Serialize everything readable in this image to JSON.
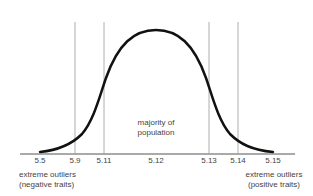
{
  "diagram": {
    "type": "bell-curve",
    "ticks": [
      {
        "label": "5.5",
        "x": 40
      },
      {
        "label": "5.9",
        "x": 75
      },
      {
        "label": "5.11",
        "x": 104
      },
      {
        "label": "5.12",
        "x": 156
      },
      {
        "label": "5.13",
        "x": 209
      },
      {
        "label": "5.14",
        "x": 238
      },
      {
        "label": "5.15",
        "x": 273
      }
    ],
    "center_label_line1": "majority of",
    "center_label_line2": "population",
    "left_label_line1": "extreme outliers",
    "left_label_line2": "(negative traits)",
    "right_label_line1": "extreme outliers",
    "right_label_line2": "(positive traits)",
    "colors": {
      "curve": "#111111",
      "axis": "#555555",
      "guide": "#888888",
      "text": "#444444"
    }
  }
}
